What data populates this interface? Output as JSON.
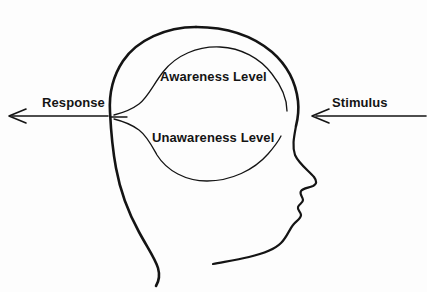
{
  "figure": {
    "type": "schematic-diagram",
    "background_color": "#fdfdfd",
    "line_color": "#141414",
    "text_color": "#141414"
  },
  "labels": {
    "awareness": "Awareness Level",
    "unawareness": "Unawareness Level",
    "response": "Response",
    "stimulus": "Stimulus"
  },
  "arrows": [
    {
      "name": "response-arrow",
      "label": "Response",
      "direction": "left",
      "meaning": "output leaving the head toward the left"
    },
    {
      "name": "stimulus-arrow",
      "label": "Stimulus",
      "direction": "left",
      "meaning": "input entering the head from the right"
    }
  ],
  "regions": [
    {
      "name": "awareness-region",
      "label": "Awareness Level",
      "position": "upper half of the brain outline"
    },
    {
      "name": "unawareness-region",
      "label": "Unawareness Level",
      "position": "lower half of the brain outline"
    }
  ]
}
